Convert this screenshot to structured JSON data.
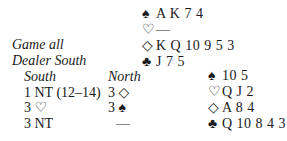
{
  "north_hand": {
    "spades": "A K 7 4",
    "hearts": "—",
    "diamonds": "K Q 10 9 5 3",
    "clubs": "J 7 5"
  },
  "east_hand": {
    "spades": "10 5",
    "hearts": "Q J 2",
    "diamonds": "A 8 4",
    "clubs": "Q 10 8 4 3"
  },
  "conditions": {
    "vulnerability": "Game all",
    "dealer": "Dealer South"
  },
  "auction": {
    "headers": {
      "south": "South",
      "north": "North"
    },
    "rows": [
      {
        "south": "1 NT (12–14)",
        "north": "3 ◇"
      },
      {
        "south": "3 ♡",
        "north": "3 ♠"
      },
      {
        "south": "3 NT",
        "north": "—"
      }
    ]
  },
  "suit_symbols": {
    "spades": "♠",
    "hearts": "♡",
    "diamonds": "◇",
    "clubs": "♣"
  }
}
